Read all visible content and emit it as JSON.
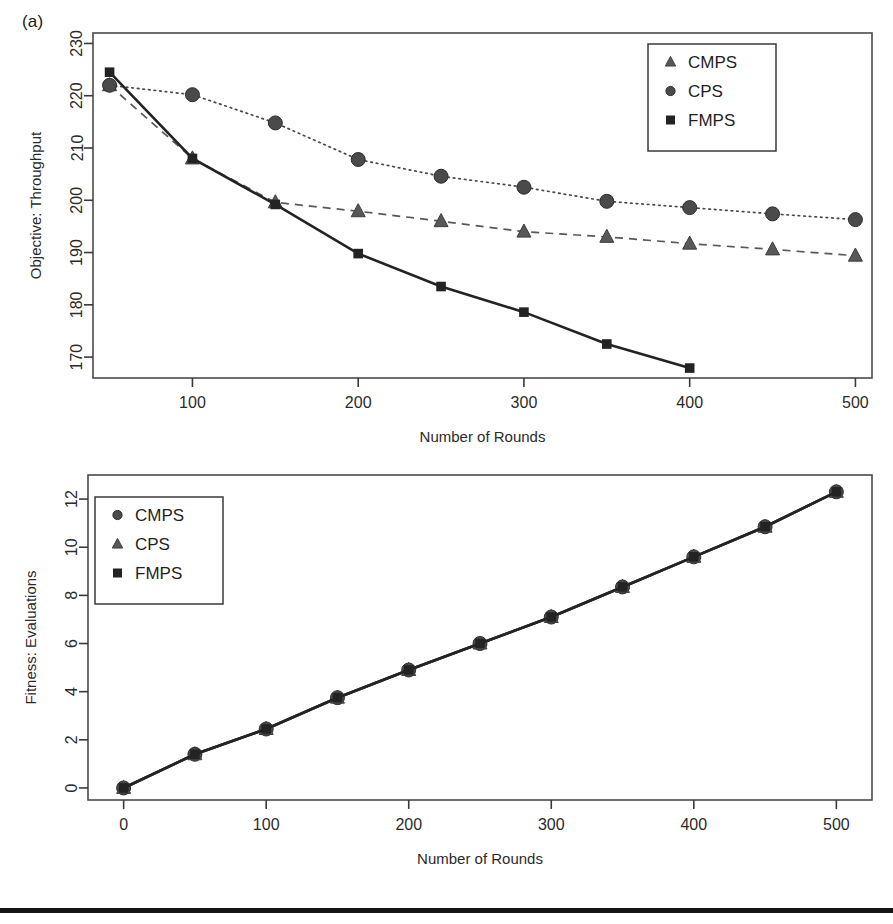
{
  "figure": {
    "panel_a_tag": "(a)",
    "background": "#ffffff",
    "foreground": "#1a1a1a"
  },
  "chart_data": [
    {
      "type": "line",
      "panel": "(a)",
      "title": "",
      "xlabel": "Number of Rounds",
      "ylabel": "Objective: Throughput",
      "xlim": [
        40,
        510
      ],
      "ylim": [
        166,
        232
      ],
      "xticks": [
        100,
        200,
        300,
        400,
        500
      ],
      "yticks": [
        170,
        180,
        190,
        200,
        210,
        220,
        230
      ],
      "grid": false,
      "legend_position": "top-right",
      "legend": [
        "CMPS",
        "CPS",
        "FMPS"
      ],
      "legend_markers": [
        "triangle",
        "circle",
        "square"
      ],
      "x": [
        50,
        100,
        150,
        200,
        250,
        300,
        350,
        400,
        450,
        500
      ],
      "series": [
        {
          "name": "CMPS",
          "marker": "triangle",
          "linestyle": "dashed",
          "color": "#585858",
          "values": [
            222.0,
            208.0,
            199.6,
            197.9,
            196.0,
            194.0,
            193.0,
            191.7,
            190.6,
            189.4
          ]
        },
        {
          "name": "CPS",
          "marker": "circle",
          "linestyle": "dotted",
          "color": "#4a4a4a",
          "values": [
            222.0,
            220.2,
            214.8,
            207.8,
            204.6,
            202.5,
            199.8,
            198.6,
            197.4,
            196.3
          ]
        },
        {
          "name": "FMPS",
          "marker": "square",
          "linestyle": "solid",
          "color": "#232323",
          "values": [
            224.5,
            208.0,
            199.2,
            189.8,
            183.5,
            178.6,
            172.5,
            167.9,
            null,
            null
          ]
        }
      ]
    },
    {
      "type": "line",
      "panel": "(b)",
      "title": "",
      "xlabel": "Number of Rounds",
      "ylabel": "Fitness: Evaluations",
      "xlim": [
        -25,
        525
      ],
      "ylim": [
        -0.5,
        13.0
      ],
      "xticks": [
        0,
        100,
        200,
        300,
        400,
        500
      ],
      "yticks": [
        0,
        2,
        4,
        6,
        8,
        10,
        12
      ],
      "grid": false,
      "legend_position": "top-left",
      "legend": [
        "CMPS",
        "CPS",
        "FMPS"
      ],
      "legend_markers": [
        "circle",
        "triangle",
        "square"
      ],
      "x": [
        0,
        50,
        100,
        150,
        200,
        250,
        300,
        350,
        400,
        450,
        500
      ],
      "series": [
        {
          "name": "CMPS",
          "marker": "circle",
          "linestyle": "solid",
          "color": "#4a4a4a",
          "values": [
            0.0,
            1.4,
            2.45,
            3.75,
            4.9,
            6.0,
            7.1,
            8.35,
            9.6,
            10.85,
            12.3
          ]
        },
        {
          "name": "CPS",
          "marker": "triangle",
          "linestyle": "solid",
          "color": "#585858",
          "values": [
            0.0,
            1.4,
            2.45,
            3.75,
            4.9,
            6.0,
            7.1,
            8.35,
            9.6,
            10.85,
            12.3
          ]
        },
        {
          "name": "FMPS",
          "marker": "square",
          "linestyle": "solid",
          "color": "#232323",
          "values": [
            0.0,
            1.4,
            2.45,
            3.75,
            4.9,
            6.0,
            7.1,
            8.35,
            9.6,
            10.85,
            12.3
          ]
        }
      ]
    }
  ]
}
